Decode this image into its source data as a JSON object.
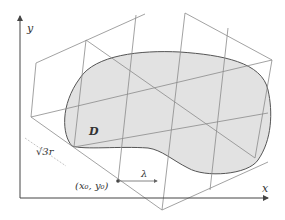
{
  "figure": {
    "colors": {
      "background": "#ffffff",
      "axis": "#444444",
      "grid": "#8a8a8a",
      "region_fill": "#e2e2e2",
      "region_stroke": "#555555",
      "text": "#333333"
    },
    "axes": {
      "x_label": "x",
      "y_label": "y"
    },
    "region_label": "D",
    "origin_label": "(x₀, y₀)",
    "spacing_label": "√3r",
    "lambda_label": "λ"
  }
}
